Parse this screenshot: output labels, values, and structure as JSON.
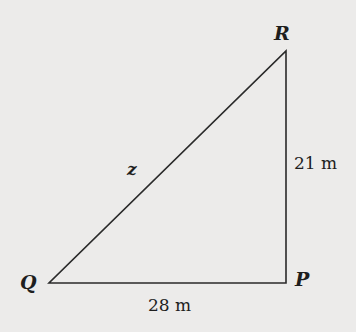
{
  "diagram": {
    "type": "right-triangle",
    "vertices": {
      "Q": {
        "label": "Q",
        "x": 49,
        "y": 283
      },
      "P": {
        "label": "P",
        "x": 286,
        "y": 283
      },
      "R": {
        "label": "R",
        "x": 286,
        "y": 51
      }
    },
    "sides": {
      "QP": {
        "label": "28 m"
      },
      "PR": {
        "label": "21 m"
      },
      "QR": {
        "label": "z"
      }
    },
    "colors": {
      "line": "#2a2a2a",
      "background": "#ecebea"
    }
  }
}
